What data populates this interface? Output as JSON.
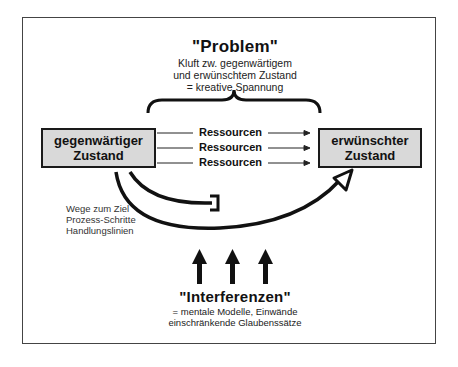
{
  "problem": {
    "title": "\"Problem\"",
    "lines": [
      "Kluft zw. gegenwärtigem",
      "und erwünschtem Zustand",
      "= kreative Spannung"
    ]
  },
  "current_state": {
    "lines": [
      "gegenwärtiger",
      "Zustand"
    ]
  },
  "desired_state": {
    "lines": [
      "erwünschter",
      "Zustand"
    ]
  },
  "resources": [
    "Ressourcen",
    "Ressourcen",
    "Ressourcen"
  ],
  "paths_note": {
    "lines": [
      "Wege zum Ziel",
      "Prozess-Schritte",
      "Handlungslinien"
    ]
  },
  "interferences": {
    "title": "\"Interferenzen\"",
    "lines": [
      "= mentale Modelle, Einwände",
      "einschränkende Glaubenssätze"
    ]
  },
  "colors": {
    "box_fill": "#d9d9d9",
    "stroke": "#1a1a1a",
    "frame": "#444444"
  }
}
